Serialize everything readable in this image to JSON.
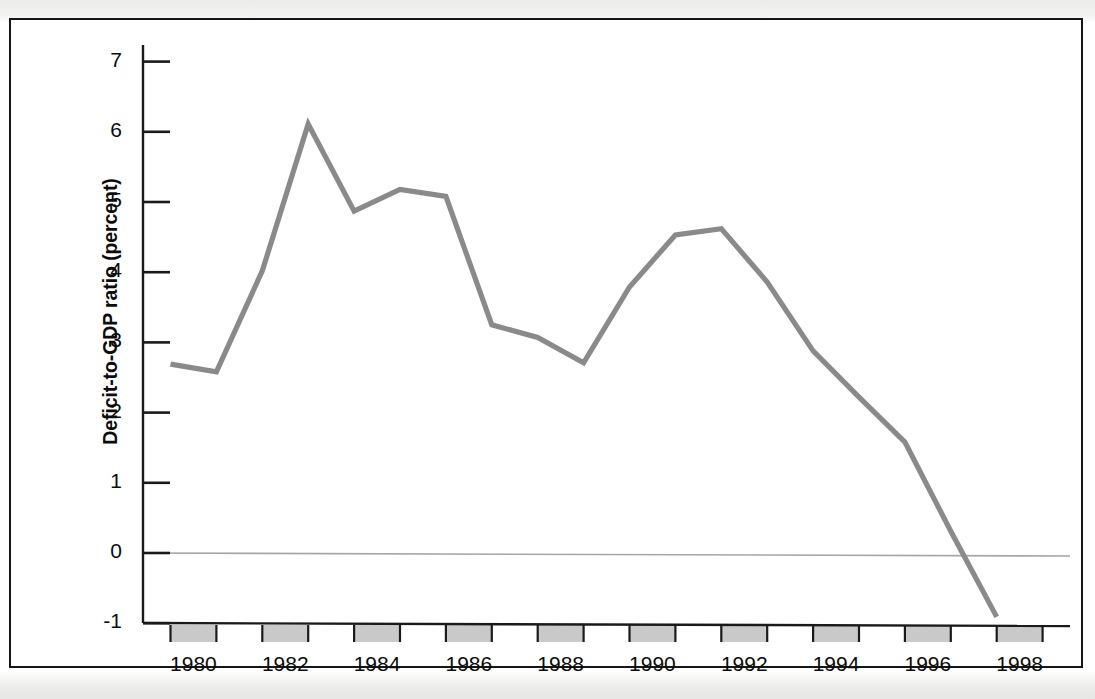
{
  "figure": {
    "kind": "scanned-line-chart",
    "background_color": "#ffffff",
    "frame_color": "#161616"
  },
  "chart_data": {
    "type": "line",
    "title": "",
    "subtitle": "",
    "xlabel": "",
    "ylabel": "Deficit-to-GDP ratio (percent)",
    "x": [
      1980,
      1981,
      1982,
      1983,
      1984,
      1985,
      1986,
      1987,
      1988,
      1989,
      1990,
      1991,
      1992,
      1993,
      1994,
      1995,
      1996,
      1997,
      1998
    ],
    "values": [
      2.69,
      2.58,
      4.02,
      6.11,
      4.87,
      5.18,
      5.08,
      3.25,
      3.07,
      2.71,
      3.79,
      4.53,
      4.62,
      3.86,
      2.88,
      2.22,
      1.58,
      0.31,
      -0.91
    ],
    "series": [
      {
        "name": "Deficit-to-GDP ratio",
        "color": "#8a8a8a",
        "values": [
          2.69,
          2.58,
          4.02,
          6.11,
          4.87,
          5.18,
          5.08,
          3.25,
          3.07,
          2.71,
          3.79,
          4.53,
          4.62,
          3.86,
          2.88,
          2.22,
          1.58,
          0.31,
          -0.91
        ]
      }
    ],
    "xlim": [
      1979.5,
      1998.5
    ],
    "ylim": [
      -1,
      7
    ],
    "yticks": [
      -1,
      0,
      1,
      2,
      3,
      4,
      5,
      6,
      7
    ],
    "ytick_labels": [
      "-1",
      "0",
      "1",
      "2",
      "3",
      "4",
      "5",
      "6",
      "7"
    ],
    "xticks": [
      1980,
      1982,
      1984,
      1986,
      1988,
      1990,
      1992,
      1994,
      1996,
      1998
    ],
    "xtick_labels": [
      "1980",
      "1982",
      "1984",
      "1986",
      "1988",
      "1990",
      "1992",
      "1994",
      "1996",
      "1998"
    ],
    "grid": false,
    "zero_line": true,
    "zero_line_color": "#9a9a9a",
    "legend": "none",
    "axis_band_shading": {
      "description": "alternating gray bands along x-axis between year ticks",
      "color": "#c9c9c9",
      "band_years": [
        1980,
        1982,
        1984,
        1986,
        1988,
        1990,
        1992,
        1994,
        1996,
        1998
      ]
    }
  },
  "axes": {
    "y_axis_label": "Deficit-to-GDP ratio (percent)",
    "y_ticks": [
      {
        "label": "7",
        "value": 7
      },
      {
        "label": "6",
        "value": 6
      },
      {
        "label": "5",
        "value": 5
      },
      {
        "label": "4",
        "value": 4
      },
      {
        "label": "3",
        "value": 3
      },
      {
        "label": "2",
        "value": 2
      },
      {
        "label": "1",
        "value": 1
      },
      {
        "label": "0",
        "value": 0
      },
      {
        "label": "-1",
        "value": -1
      }
    ],
    "x_ticks": [
      {
        "label": "1980",
        "value": 1980
      },
      {
        "label": "1982",
        "value": 1982
      },
      {
        "label": "1984",
        "value": 1984
      },
      {
        "label": "1986",
        "value": 1986
      },
      {
        "label": "1988",
        "value": 1988
      },
      {
        "label": "1990",
        "value": 1990
      },
      {
        "label": "1992",
        "value": 1992
      },
      {
        "label": "1994",
        "value": 1994
      },
      {
        "label": "1996",
        "value": 1996
      },
      {
        "label": "1998",
        "value": 1998
      }
    ]
  }
}
